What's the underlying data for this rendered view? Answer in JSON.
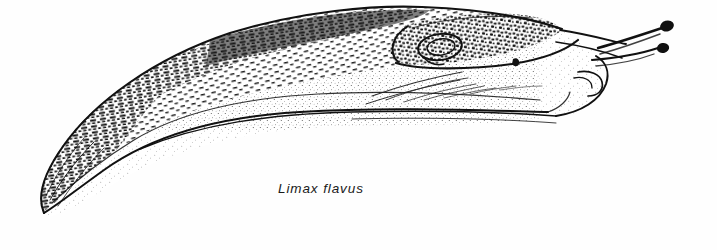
{
  "figure": {
    "kind": "scientific-line-illustration",
    "caption": "Limax flavus",
    "background_color": "#fefefe",
    "ink_color": "#111111",
    "technique": "pen-and-ink stipple and dash hatching",
    "canvas": {
      "width": 717,
      "height": 250
    }
  },
  "anatomy": {
    "parts": [
      {
        "name": "tail-tip",
        "label": "tail tip",
        "x": 42,
        "y": 210
      },
      {
        "name": "dorsal-keel",
        "label": "dorsal keel",
        "x": 300,
        "y": 18
      },
      {
        "name": "mantle",
        "label": "mantle shield",
        "x": 450,
        "y": 40
      },
      {
        "name": "mantle-loop",
        "label": "concentric mantle ridge",
        "x": 438,
        "y": 47
      },
      {
        "name": "pneumostome",
        "label": "pneumostome (breathing pore)",
        "x": 516,
        "y": 62
      },
      {
        "name": "upper-tentacle",
        "label": "upper optical tentacle",
        "x": 668,
        "y": 27
      },
      {
        "name": "lower-tentacle",
        "label": "lower sensory tentacle",
        "x": 664,
        "y": 50
      },
      {
        "name": "head-lip",
        "label": "head and mouth lip",
        "x": 600,
        "y": 80
      },
      {
        "name": "foot-sole",
        "label": "foot sole fringe",
        "x": 420,
        "y": 114
      },
      {
        "name": "flank-stipple",
        "label": "stippled flank",
        "x": 330,
        "y": 85
      }
    ]
  },
  "caption_block": {
    "text": "Limax flavus",
    "style": "italic",
    "position": {
      "x": 278,
      "y": 181
    }
  }
}
